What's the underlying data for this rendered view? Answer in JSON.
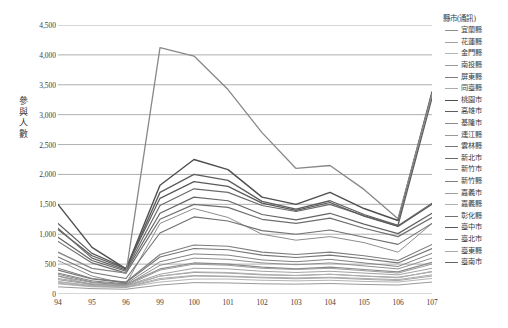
{
  "chart_data": {
    "type": "line",
    "title": "",
    "xlabel": "",
    "ylabel": "參與人數",
    "legend_title": "縣市(通訊)",
    "legend_position": "right",
    "grid": true,
    "x": [
      "94",
      "95",
      "96",
      "99",
      "100",
      "101",
      "102",
      "103",
      "104",
      "105",
      "106",
      "107"
    ],
    "ylim": [
      0,
      4500
    ],
    "ytick_step": 500,
    "ytick_labels": [
      "4,500",
      "4,000",
      "3,500",
      "3,000",
      "2,500",
      "2,000",
      "1,500",
      "1,000",
      "500",
      "0"
    ],
    "ytick_values": [
      4500,
      4000,
      3500,
      3000,
      2500,
      2000,
      1500,
      1000,
      500,
      0
    ],
    "series": [
      {
        "name": "宜蘭縣",
        "color": "#8e8e8e",
        "width": 1.0,
        "values": [
          560,
          300,
          170,
          1180,
          1430,
          1280,
          1000,
          900,
          960,
          860,
          700,
          1180
        ]
      },
      {
        "name": "花蓮縣",
        "color": "#a3a3a3",
        "width": 1.0,
        "values": [
          300,
          150,
          140,
          330,
          430,
          420,
          380,
          360,
          380,
          350,
          320,
          430
        ]
      },
      {
        "name": "金門縣",
        "color": "#b5b5b5",
        "width": 1.0,
        "values": [
          170,
          120,
          110,
          200,
          250,
          250,
          230,
          220,
          230,
          210,
          200,
          260
        ]
      },
      {
        "name": "南投縣",
        "color": "#9a9a9a",
        "width": 1.0,
        "values": [
          240,
          160,
          130,
          300,
          360,
          350,
          320,
          310,
          330,
          300,
          280,
          370
        ]
      },
      {
        "name": "屏東縣",
        "color": "#7d7d7d",
        "width": 1.1,
        "values": [
          430,
          260,
          200,
          660,
          820,
          800,
          700,
          660,
          700,
          640,
          560,
          830
        ]
      },
      {
        "name": "同臺縣",
        "color": "#acacac",
        "width": 1.0,
        "values": [
          210,
          140,
          120,
          260,
          310,
          300,
          280,
          270,
          280,
          260,
          240,
          320
        ]
      },
      {
        "name": "桃園市",
        "color": "#4e4e4e",
        "width": 1.4,
        "values": [
          1500,
          780,
          420,
          1820,
          2250,
          2080,
          1620,
          1500,
          1700,
          1430,
          1230,
          3380
        ]
      },
      {
        "name": "高雄市",
        "color": "#5d5d5d",
        "width": 1.3,
        "values": [
          1080,
          640,
          420,
          1700,
          2000,
          1900,
          1550,
          1420,
          1560,
          1330,
          1150,
          3280
        ]
      },
      {
        "name": "基隆市",
        "color": "#8a8a8a",
        "width": 1.1,
        "values": [
          330,
          200,
          160,
          420,
          520,
          500,
          450,
          420,
          450,
          410,
          370,
          530
        ]
      },
      {
        "name": "連江縣",
        "color": "#999999",
        "width": 1.0,
        "values": [
          120,
          90,
          80,
          150,
          190,
          185,
          170,
          165,
          175,
          160,
          150,
          200
        ]
      },
      {
        "name": "雲林縣",
        "color": "#767676",
        "width": 1.1,
        "values": [
          400,
          250,
          190,
          620,
          760,
          740,
          650,
          610,
          650,
          590,
          520,
          760
        ]
      },
      {
        "name": "新北市",
        "color": "#6a6a6a",
        "width": 1.2,
        "values": [
          1100,
          600,
          400,
          1480,
          1760,
          1700,
          1480,
          1380,
          1500,
          1310,
          1140,
          1520
        ]
      },
      {
        "name": "新竹市",
        "color": "#909090",
        "width": 1.0,
        "values": [
          300,
          190,
          150,
          480,
          600,
          580,
          520,
          490,
          520,
          470,
          420,
          600
        ]
      },
      {
        "name": "新竹縣",
        "color": "#828282",
        "width": 1.0,
        "values": [
          350,
          220,
          170,
          540,
          670,
          650,
          570,
          540,
          580,
          520,
          460,
          680
        ]
      },
      {
        "name": "嘉義市",
        "color": "#9e9e9e",
        "width": 1.0,
        "values": [
          260,
          170,
          140,
          400,
          500,
          480,
          430,
          410,
          430,
          390,
          350,
          500
        ]
      },
      {
        "name": "嘉義縣",
        "color": "#b0b0b0",
        "width": 1.0,
        "values": [
          200,
          140,
          120,
          300,
          370,
          360,
          330,
          310,
          330,
          300,
          270,
          380
        ]
      },
      {
        "name": "彰化縣",
        "color": "#717171",
        "width": 1.1,
        "values": [
          620,
          360,
          260,
          1020,
          1290,
          1220,
          1060,
          1000,
          1070,
          950,
          830,
          1180
        ]
      },
      {
        "name": "臺中市",
        "color": "#595959",
        "width": 1.2,
        "values": [
          1180,
          680,
          430,
          1600,
          1880,
          1800,
          1520,
          1400,
          1530,
          1300,
          1130,
          1500
        ]
      },
      {
        "name": "臺北市",
        "color": "#6f6f6f",
        "width": 1.2,
        "values": [
          880,
          520,
          350,
          1250,
          1500,
          1450,
          1250,
          1180,
          1270,
          1100,
          960,
          1280
        ]
      },
      {
        "name": "臺東縣",
        "color": "#a8a8a8",
        "width": 1.0,
        "values": [
          180,
          130,
          110,
          240,
          300,
          290,
          270,
          255,
          270,
          245,
          225,
          300
        ]
      },
      {
        "name": "臺南市",
        "color": "#646464",
        "width": 1.2,
        "values": [
          950,
          560,
          380,
          1350,
          1620,
          1560,
          1330,
          1240,
          1350,
          1170,
          1010,
          1350
        ]
      },
      {
        "name": "峰値線",
        "color": "#888888",
        "width": 1.3,
        "values": [
          700,
          430,
          350,
          4120,
          3980,
          3420,
          2700,
          2100,
          2150,
          1750,
          1260,
          3350
        ]
      }
    ]
  },
  "legend": {
    "title": "縣市(通訊)",
    "items": [
      {
        "label": "宜蘭縣"
      },
      {
        "label": "花蓮縣"
      },
      {
        "label": "金門縣"
      },
      {
        "label": "南投縣"
      },
      {
        "label": "屏東縣"
      },
      {
        "label": "同臺縣"
      },
      {
        "label": "桃園市"
      },
      {
        "label": "高雄市"
      },
      {
        "label": "基隆市"
      },
      {
        "label": "連江縣"
      },
      {
        "label": "雲林縣"
      },
      {
        "label": "新北市"
      },
      {
        "label": "新竹市"
      },
      {
        "label": "新竹縣"
      },
      {
        "label": "嘉義市"
      },
      {
        "label": "嘉義縣"
      },
      {
        "label": "彰化縣"
      },
      {
        "label": "臺中市"
      },
      {
        "label": "臺北市"
      },
      {
        "label": "臺東縣"
      },
      {
        "label": "臺南市"
      }
    ]
  },
  "axis": {
    "y_title_chars": [
      "參",
      "與",
      "人",
      "數"
    ]
  },
  "style": {
    "gridline_color": "#a6a6a6",
    "axis_text_color": "#3c3c3c",
    "background": "#ffffff"
  }
}
